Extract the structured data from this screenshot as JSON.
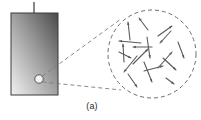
{
  "figure": {
    "caption": "(a)",
    "background_color": "#ffffff"
  },
  "block": {
    "name": "magnetized-bar",
    "x": 11,
    "y": 13,
    "width": 47,
    "height": 82,
    "border_color": "#3b3b3b",
    "gradient_dark": "#4a4a4a",
    "gradient_mid": "#9a9a9a",
    "gradient_light": "#f2f2f2",
    "stem": {
      "name": "top-stem",
      "x": 34,
      "y_top": 2,
      "y_bottom": 13,
      "color": "#6a6a6a",
      "width": 1.6
    },
    "probe_circle": {
      "name": "sample-region-marker",
      "cx": 39,
      "cy": 79,
      "r": 4.2,
      "stroke": "#4a4a4a",
      "fill": "#ffffff"
    }
  },
  "magnifier": {
    "name": "magnified-domain-view",
    "circle": {
      "cx": 152,
      "cy": 54,
      "r": 44,
      "stroke": "#6d6d6d",
      "dash": "4 3"
    },
    "leader_lines": [
      {
        "name": "leader-line-upper",
        "x1": 42.5,
        "y1": 76,
        "x2": 121,
        "y2": 19
      },
      {
        "name": "leader-line-lower",
        "x1": 42.5,
        "y1": 82,
        "x2": 121,
        "y2": 90
      }
    ]
  },
  "domain_arrows": {
    "name": "random-domain-vectors",
    "color": "#5a5a5a",
    "stroke_width": 1.1,
    "head_size": 3.2,
    "items": [
      {
        "name": "domain-arrow-1",
        "x1": 130,
        "y1": 40,
        "x2": 128,
        "y2": 22
      },
      {
        "name": "domain-arrow-2",
        "x1": 158,
        "y1": 36,
        "x2": 172,
        "y2": 26
      },
      {
        "name": "domain-arrow-3",
        "x1": 148,
        "y1": 30,
        "x2": 139,
        "y2": 18
      },
      {
        "name": "domain-arrow-4",
        "x1": 141,
        "y1": 43,
        "x2": 119,
        "y2": 41
      },
      {
        "name": "domain-arrow-5",
        "x1": 152,
        "y1": 47,
        "x2": 133,
        "y2": 47
      },
      {
        "name": "domain-arrow-6",
        "x1": 124,
        "y1": 62,
        "x2": 123,
        "y2": 44
      },
      {
        "name": "domain-arrow-7",
        "x1": 133,
        "y1": 64,
        "x2": 148,
        "y2": 49
      },
      {
        "name": "domain-arrow-8",
        "x1": 158,
        "y1": 68,
        "x2": 172,
        "y2": 52
      },
      {
        "name": "domain-arrow-9",
        "x1": 147,
        "y1": 37,
        "x2": 150,
        "y2": 58
      },
      {
        "name": "domain-arrow-10",
        "x1": 178,
        "y1": 42,
        "x2": 184,
        "y2": 58
      },
      {
        "name": "domain-arrow-11",
        "x1": 163,
        "y1": 58,
        "x2": 176,
        "y2": 70
      },
      {
        "name": "domain-arrow-12",
        "x1": 144,
        "y1": 71,
        "x2": 163,
        "y2": 66
      },
      {
        "name": "domain-arrow-13",
        "x1": 137,
        "y1": 56,
        "x2": 124,
        "y2": 72
      },
      {
        "name": "domain-arrow-14",
        "x1": 144,
        "y1": 62,
        "x2": 152,
        "y2": 82
      },
      {
        "name": "domain-arrow-15",
        "x1": 128,
        "y1": 74,
        "x2": 137,
        "y2": 87
      },
      {
        "name": "domain-arrow-16",
        "x1": 171,
        "y1": 31,
        "x2": 160,
        "y2": 43
      },
      {
        "name": "domain-arrow-17",
        "x1": 119,
        "y1": 52,
        "x2": 131,
        "y2": 58
      },
      {
        "name": "domain-arrow-18",
        "x1": 166,
        "y1": 78,
        "x2": 174,
        "y2": 84
      }
    ]
  }
}
